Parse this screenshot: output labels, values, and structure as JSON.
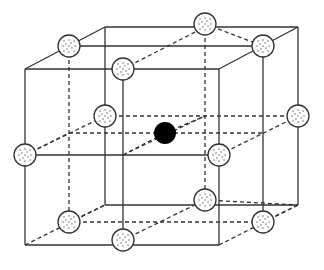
{
  "diagram": {
    "title": "",
    "colors": {
      "line": "#333333",
      "center_atom": "#000000",
      "edge_atom_fill": "#ffffff",
      "background": "#ffffff"
    },
    "solid_lines": [
      [
        25,
        69,
        219,
        69
      ],
      [
        25,
        69,
        25,
        245
      ],
      [
        25,
        245,
        219,
        245
      ],
      [
        219,
        69,
        219,
        245
      ],
      [
        105,
        27,
        298,
        27
      ],
      [
        298,
        27,
        298,
        205
      ],
      [
        25,
        69,
        105,
        27
      ],
      [
        219,
        69,
        298,
        27
      ],
      [
        69,
        46,
        263,
        46
      ],
      [
        123,
        69,
        123,
        245
      ],
      [
        25,
        155,
        219,
        155
      ],
      [
        263,
        46,
        263,
        222
      ],
      [
        105,
        27,
        105,
        205
      ],
      [
        105,
        205,
        298,
        205
      ]
    ],
    "dashed_lines": [
      [
        25,
        245,
        105,
        205
      ],
      [
        219,
        245,
        298,
        205
      ],
      [
        25,
        155,
        105,
        116
      ],
      [
        219,
        155,
        298,
        116
      ],
      [
        69,
        46,
        69,
        222
      ],
      [
        205,
        24,
        205,
        200
      ],
      [
        105,
        116,
        298,
        116
      ],
      [
        69,
        222,
        263,
        222
      ],
      [
        123,
        240,
        205,
        200
      ],
      [
        205,
        200,
        298,
        205
      ],
      [
        123,
        69,
        205,
        27
      ],
      [
        25,
        155,
        69,
        133
      ],
      [
        69,
        133,
        263,
        133
      ],
      [
        123,
        155,
        205,
        116
      ],
      [
        165,
        133,
        205,
        116
      ],
      [
        123,
        155,
        165,
        133
      ],
      [
        69,
        222,
        105,
        205
      ],
      [
        263,
        222,
        298,
        205
      ],
      [
        205,
        24,
        263,
        46
      ]
    ],
    "edge_atoms": [
      {
        "x": 69,
        "y": 46
      },
      {
        "x": 205,
        "y": 24
      },
      {
        "x": 263,
        "y": 46
      },
      {
        "x": 123,
        "y": 69
      },
      {
        "x": 105,
        "y": 116
      },
      {
        "x": 298,
        "y": 116
      },
      {
        "x": 25,
        "y": 155
      },
      {
        "x": 219,
        "y": 155
      },
      {
        "x": 69,
        "y": 222
      },
      {
        "x": 263,
        "y": 222
      },
      {
        "x": 123,
        "y": 240
      },
      {
        "x": 205,
        "y": 200
      }
    ],
    "center_atom": {
      "x": 165,
      "y": 133
    }
  }
}
